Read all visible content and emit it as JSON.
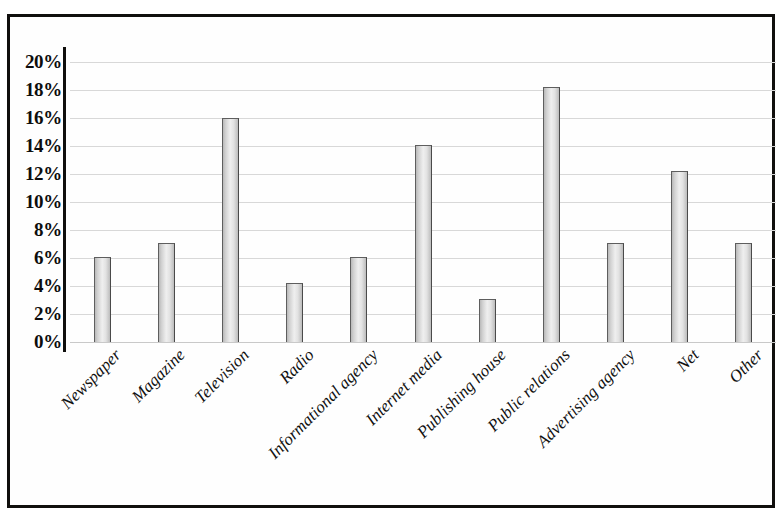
{
  "chart_data": {
    "type": "bar",
    "title": "",
    "subtitle": "",
    "xlabel": "",
    "ylabel": "",
    "ylim": [
      0,
      20
    ],
    "ytick_step": 2,
    "ytick_labels": [
      "0%",
      "2%",
      "4%",
      "6%",
      "8%",
      "10%",
      "12%",
      "14%",
      "16%",
      "18%",
      "20%"
    ],
    "grid": true,
    "legend": "none",
    "value_suffix": "%",
    "categories": [
      "Newspaper",
      "Magazine",
      "Television",
      "Radio",
      "Informational agency",
      "Internet media",
      "Publishing house",
      "Public relations",
      "Advertising agency",
      "Net",
      "Other"
    ],
    "values": [
      6.1,
      7.1,
      16.0,
      4.2,
      6.1,
      14.1,
      3.1,
      18.2,
      7.1,
      12.2,
      7.1
    ],
    "series": [
      {
        "name": "Share",
        "values": [
          6.1,
          7.1,
          16.0,
          4.2,
          6.1,
          14.1,
          3.1,
          18.2,
          7.1,
          12.2,
          7.1
        ]
      }
    ]
  },
  "style": {
    "bar_fill": "#e2e2e2",
    "bar_border": "#5e5e5e",
    "grid_color": "#d8d8d8",
    "axis_color": "#100f0d",
    "frame_color": "#100f0d",
    "background": "#ffffff"
  }
}
